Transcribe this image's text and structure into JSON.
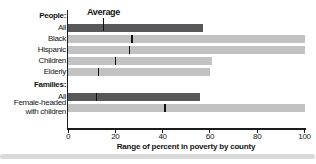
{
  "chart_data": {
    "type": "bar",
    "orientation": "horizontal",
    "title": "",
    "xlabel": "Range of percent in poverty by county",
    "ylabel": "",
    "xlim": [
      0,
      100
    ],
    "xticks": [
      0,
      20,
      40,
      60,
      80,
      100
    ],
    "average_label": "Average",
    "legend": "none",
    "grid": false,
    "note": "Each bar shows the range (0 to max) of percent in poverty by county; black tick marks the average",
    "groups": [
      {
        "label": "People:",
        "rows": [
          {
            "label": "All",
            "range_min": 0,
            "range_max": 57,
            "average": 15,
            "emphasis": true
          },
          {
            "label": "Black",
            "range_min": 0,
            "range_max": 100,
            "average": 27,
            "emphasis": false
          },
          {
            "label": "Hispanic",
            "range_min": 0,
            "range_max": 100,
            "average": 26,
            "emphasis": false
          },
          {
            "label": "Children",
            "range_min": 0,
            "range_max": 61,
            "average": 20,
            "emphasis": false
          },
          {
            "label": "Elderly",
            "range_min": 0,
            "range_max": 60,
            "average": 13,
            "emphasis": false
          }
        ]
      },
      {
        "label": "Families:",
        "rows": [
          {
            "label": "All",
            "range_min": 0,
            "range_max": 56,
            "average": 12,
            "emphasis": true
          },
          {
            "label": "Female-headed\nwith children",
            "range_min": 0,
            "range_max": 100,
            "average": 41,
            "emphasis": false
          }
        ]
      }
    ],
    "colors": {
      "emphasis_bar": "#58585a",
      "bar": "#c2c2c2",
      "average_tick": "#121212",
      "axis": "#1c1c1c",
      "text": "#141414",
      "divider": "#d9d9d9",
      "background": "#ffffff"
    }
  }
}
